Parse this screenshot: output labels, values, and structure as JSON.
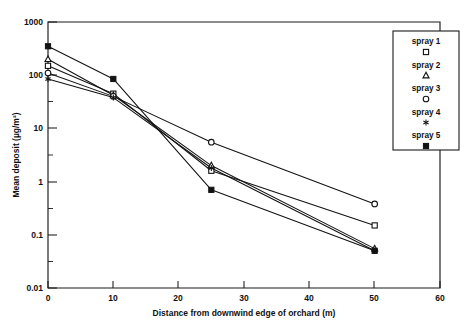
{
  "chart_data": {
    "type": "line",
    "title": "",
    "xlabel": "Distance from downwind edge of orchard (m)",
    "ylabel": "Mean deposit (µg/m²)",
    "yscale": "log",
    "xlim": [
      0,
      60
    ],
    "ylim": [
      0.01,
      1000
    ],
    "grid": false,
    "legend_position": "top-right",
    "x": [
      0,
      10,
      25,
      50
    ],
    "xticks": [
      0,
      10,
      20,
      30,
      40,
      50,
      60
    ],
    "xtick_labels": [
      "0",
      "10",
      "20",
      "30",
      "40",
      "50",
      "60"
    ],
    "yticks": [
      0.01,
      0.1,
      1,
      10,
      100,
      1000
    ],
    "ytick_labels": [
      "0.01",
      "0.1",
      "1",
      "10",
      "100",
      "1000"
    ],
    "series": [
      {
        "name": "spray 1",
        "marker": "open-square",
        "values": [
          150,
          45,
          1.6,
          0.15
        ]
      },
      {
        "name": "spray 2",
        "marker": "open-triangle",
        "values": [
          200,
          42,
          2.0,
          0.055
        ]
      },
      {
        "name": "spray 3",
        "marker": "open-circle",
        "values": [
          110,
          40,
          5.5,
          0.38
        ]
      },
      {
        "name": "spray 4",
        "marker": "star",
        "values": [
          85,
          38,
          1.8,
          0.05
        ]
      },
      {
        "name": "spray 5",
        "marker": "filled-square",
        "values": [
          350,
          85,
          0.7,
          0.05
        ]
      }
    ]
  },
  "axes": {
    "ylabel": "Mean deposit (µg/m²)",
    "xlabel": "Distance from downwind edge of orchard (m)",
    "ytick_labels": [
      "1000",
      "100",
      "10",
      "1",
      "0.1",
      "0.01"
    ],
    "xtick_labels": [
      "0",
      "10",
      "20",
      "30",
      "40",
      "50",
      "60"
    ]
  },
  "legend": {
    "items": [
      {
        "label": "spray 1",
        "marker": "open-square"
      },
      {
        "label": "spray 2",
        "marker": "open-triangle"
      },
      {
        "label": "spray 3",
        "marker": "open-circle"
      },
      {
        "label": "spray 4",
        "marker": "star"
      },
      {
        "label": "spray 5",
        "marker": "filled-square"
      }
    ]
  },
  "colors": {
    "ink": "#121212",
    "background": "#ffffff"
  }
}
